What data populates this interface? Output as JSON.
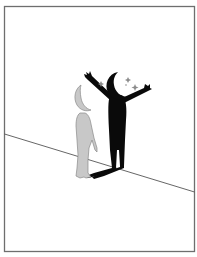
{
  "illustration": {
    "subject": "Figure with crescent-moon head casting a large black shadow with raised arms and stars",
    "colors": {
      "background": "#ffffff",
      "frame": "#6e6e6e",
      "floor_line": "#555555",
      "figure_fill": "#c8c8c8",
      "figure_outline": "#8a8a8a",
      "shadow": "#0a0a0a",
      "stars": "#8c8c8c"
    },
    "elements": [
      {
        "name": "frame",
        "shape": "rectangle"
      },
      {
        "name": "floor-line",
        "shape": "line"
      },
      {
        "name": "gray-figure",
        "head": "crescent-moon",
        "pose": "standing"
      },
      {
        "name": "shadow-figure",
        "head": "crescent-moon",
        "pose": "arms-raised"
      },
      {
        "name": "stars",
        "count": 4
      }
    ]
  }
}
